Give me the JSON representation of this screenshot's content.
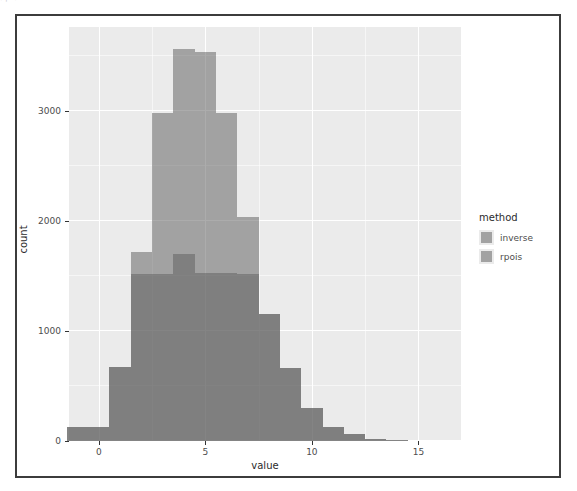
{
  "top_strip": {
    "text": "· ⌐ ·"
  },
  "chart_data": {
    "type": "bar",
    "title": "",
    "subtitle": "",
    "xlabel": "value",
    "ylabel": "count",
    "xlim": [
      -1.4,
      17.0
    ],
    "ylim": [
      0,
      3760
    ],
    "grid": true,
    "legend_position": "right",
    "legend_title": "method",
    "bin_width": 1,
    "overlap_mode": "identity-alpha",
    "x_ticks": [
      0,
      5,
      10,
      15
    ],
    "x_tick_labels": [
      "0",
      "5",
      "10",
      "15"
    ],
    "y_ticks": [
      0,
      1000,
      2000,
      3000
    ],
    "y_tick_labels": [
      "0",
      "1000",
      "2000",
      "3000"
    ],
    "x_minor_ticks": [
      2.5,
      7.5,
      12.5
    ],
    "y_minor_ticks": [
      500,
      1500,
      2500,
      3500
    ],
    "bin_centers": [
      -1,
      0,
      1,
      2,
      3,
      4,
      5,
      6,
      7,
      8,
      9,
      10,
      11,
      12,
      13,
      14
    ],
    "series": [
      {
        "name": "inverse",
        "color": "#606060",
        "alpha": 0.52,
        "values": [
          130,
          130,
          670,
          1720,
          2980,
          3560,
          3530,
          2980,
          2030,
          1150,
          660,
          300,
          130,
          60,
          20,
          10
        ]
      },
      {
        "name": "rpois",
        "color": "#606060",
        "alpha": 0.52,
        "values": [
          130,
          130,
          670,
          1520,
          1520,
          1700,
          1530,
          1530,
          1520,
          1150,
          660,
          300,
          130,
          60,
          20,
          10
        ]
      }
    ]
  },
  "legend": {
    "title": "method",
    "items": [
      {
        "label": "inverse"
      },
      {
        "label": "rpois"
      }
    ]
  }
}
